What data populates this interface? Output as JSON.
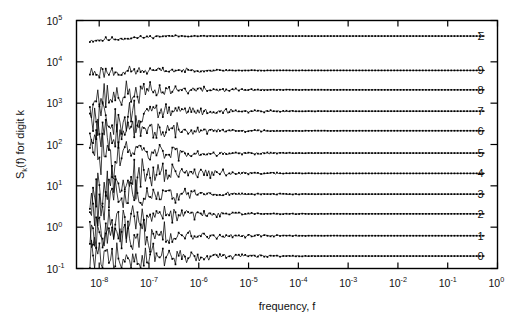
{
  "chart_data": {
    "type": "line",
    "title": "",
    "xlabel": "frequency, f",
    "ylabel": "S_k(f) for digit k",
    "ylabel_parts": {
      "base": "S",
      "sub": "k",
      "rest": "(f) for digit k"
    },
    "xscale": "log",
    "yscale": "log",
    "xlim": [
      3.5e-09,
      1.0
    ],
    "ylim": [
      0.1,
      100000
    ],
    "grid": false,
    "legend_position": "right-inline",
    "x_ticks": [
      {
        "value": 1e-08,
        "mantissa": "10",
        "exponent": "-8"
      },
      {
        "value": 1e-07,
        "mantissa": "10",
        "exponent": "-7"
      },
      {
        "value": 1e-06,
        "mantissa": "10",
        "exponent": "-6"
      },
      {
        "value": 1e-05,
        "mantissa": "10",
        "exponent": "-5"
      },
      {
        "value": 0.0001,
        "mantissa": "10",
        "exponent": "-4"
      },
      {
        "value": 0.001,
        "mantissa": "10",
        "exponent": "-3"
      },
      {
        "value": 0.01,
        "mantissa": "10",
        "exponent": "-2"
      },
      {
        "value": 0.1,
        "mantissa": "10",
        "exponent": "-1"
      },
      {
        "value": 1.0,
        "mantissa": "10",
        "exponent": "0"
      }
    ],
    "y_ticks": [
      {
        "value": 100000,
        "mantissa": "10",
        "exponent": "5"
      },
      {
        "value": 10000,
        "mantissa": "10",
        "exponent": "4"
      },
      {
        "value": 1000,
        "mantissa": "10",
        "exponent": "3"
      },
      {
        "value": 100,
        "mantissa": "10",
        "exponent": "2"
      },
      {
        "value": 10,
        "mantissa": "10",
        "exponent": "1"
      },
      {
        "value": 1,
        "mantissa": "10",
        "exponent": "0"
      },
      {
        "value": 0.1,
        "mantissa": "10",
        "exponent": "-1"
      }
    ],
    "series": [
      {
        "name": "sum",
        "label": "Σ",
        "plateau": 42000,
        "start": 33000,
        "noise": 0.045,
        "seed": 11
      },
      {
        "name": "digit-9",
        "label": "9",
        "plateau": 6200,
        "start": 5600,
        "noise": 0.13,
        "seed": 23
      },
      {
        "name": "digit-8",
        "label": "8",
        "plateau": 2100,
        "start": 1250,
        "noise": 0.3,
        "seed": 37
      },
      {
        "name": "digit-7",
        "label": "7",
        "plateau": 640,
        "start": 330,
        "noise": 0.42,
        "seed": 51
      },
      {
        "name": "digit-6",
        "label": "6",
        "plateau": 215,
        "start": 230,
        "noise": 0.36,
        "seed": 67
      },
      {
        "name": "digit-5",
        "label": "5",
        "plateau": 62,
        "start": 62,
        "noise": 0.4,
        "seed": 83
      },
      {
        "name": "digit-4",
        "label": "4",
        "plateau": 20,
        "start": 8.5,
        "noise": 0.45,
        "seed": 97
      },
      {
        "name": "digit-3",
        "label": "3",
        "plateau": 6.3,
        "start": 5.4,
        "noise": 0.42,
        "seed": 113
      },
      {
        "name": "digit-2",
        "label": "2",
        "plateau": 2.1,
        "start": 0.78,
        "noise": 0.4,
        "seed": 131
      },
      {
        "name": "digit-1",
        "label": "1",
        "plateau": 0.62,
        "start": 0.74,
        "noise": 0.44,
        "seed": 149
      },
      {
        "name": "digit-0",
        "label": "0",
        "plateau": 0.2,
        "start": 0.23,
        "noise": 0.46,
        "seed": 167
      }
    ]
  }
}
